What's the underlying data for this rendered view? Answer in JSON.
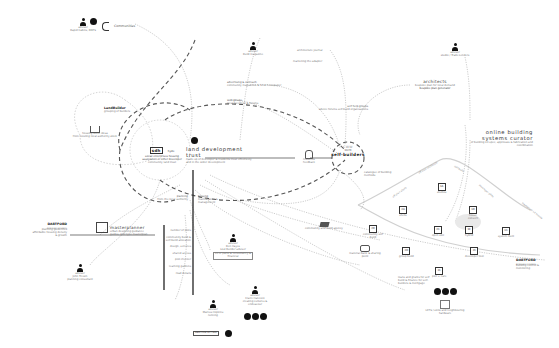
{
  "diagram": {
    "central": {
      "land_trust": {
        "title": "land development trust",
        "desc": "made up of developer & residents trust effectively and in the wider development"
      },
      "self_builders": {
        "logo": "CWW",
        "sub": "WLTB",
        "title": "self-builders"
      },
      "social_enterprises": {
        "logo": "sdh",
        "logo2": "hyde",
        "title": "social enterprises housing association or other developer",
        "desc": "community land trust"
      },
      "masterplanner": {
        "title": "masterplanner",
        "desc": "urban designing guidance guides, plot type masterplan"
      },
      "architects": {
        "title": "architects",
        "desc": "bespoke plan for local demand",
        "emph": "bespoke plan generator"
      },
      "online_curator": {
        "title": "online building systems curator",
        "desc": "of building kit spec, approvals & fabrication and coordination"
      }
    },
    "people": [
      {
        "id": "person-top-left",
        "role": "advisor",
        "name": "Rapid Cabins, BDPS"
      },
      {
        "id": "person-top-mid",
        "role": "advisor",
        "name": "Build magazine"
      },
      {
        "id": "person-architect",
        "role": "advisor",
        "name": "studio / Trade Lenders"
      },
      {
        "id": "person-planning",
        "role": "advisor",
        "name": "John Trewin",
        "extra": "planning consultant"
      },
      {
        "id": "person-finance",
        "role": "advisor",
        "name": "Ben Hayes",
        "extra": "Lost Builder adviser",
        "desc": "kit of parts & consultancy & financial"
      },
      {
        "id": "person-community",
        "role": "advisor",
        "name": "Claire Hancock",
        "extra": "creating cultures & endeavour"
      },
      {
        "id": "person-heritage",
        "role": "advisor",
        "name": "Marcus Hopkins",
        "extra": "running"
      }
    ],
    "labels": {
      "communities": "Communities",
      "landbuilder": "LandBuilder",
      "landbuilder_sub": "grouping of builders",
      "housing_stock": "housing stock ideas",
      "housing_stock_sub": "from existing local authority stock",
      "architecture_journal": "architecture journal",
      "marketing": "marketing the adapter",
      "advertising": "advertising & outreach",
      "advertising_sub": "community magazines & local newspaper",
      "web_groups": "web groups",
      "web_groups_sub": "local facebook & forums",
      "self_help": "self help groups",
      "self_help_sub": "advice forums self-build organisations",
      "planning": "planning",
      "planning_sub": "from the local authority",
      "housing_mgmt": "housing",
      "housing_mgmt_sub": "maintenance & management",
      "residents_feedback": "residents feedback",
      "ideas_building": "catalogue of building methods",
      "community_agency": "community and build agency",
      "materials_bank": "material bank & sharing point",
      "loan_text": "loans and grants for self build & finance for self-builders & mortgage",
      "lets_exchange": "LETS / skills and neighbouring hardware",
      "dartford_left": "DARTFORD",
      "dartford_left_sub": "BOROUGH COUNCIL",
      "dartford_left_desc": "planning guidelines affordable housing density & growth",
      "dartford_right": "DARTFORD",
      "dartford_right_sub": "BOROUGH COUNCIL",
      "dartford_right_desc": "building control & monitoring",
      "heritage_tag": "HERITAGE LOTTERY",
      "list_items": [
        "number of plots",
        "community build & self-build allocation",
        "design, services",
        "shared access",
        "plot checker",
        "learning gardens",
        "road details"
      ]
    },
    "build_types": [
      {
        "code": "1A",
        "label": "studios"
      },
      {
        "code": "1B",
        "label": "house convert"
      },
      {
        "code": "1C",
        "label": "system built"
      },
      {
        "code": "2A",
        "label": "shells"
      },
      {
        "code": "2B",
        "label": "community self build"
      },
      {
        "code": "2C",
        "label": "open slot"
      },
      {
        "code": "2D",
        "label": "group build"
      },
      {
        "code": "1E",
        "label": "hybrid"
      },
      {
        "code": "2C",
        "label": "developer tool"
      },
      {
        "code": "3C",
        "label": "plot + care"
      }
    ],
    "axis_labels": [
      "off plan architects",
      "off plan shells",
      "self-build",
      "developer plots",
      "tradesman kit homes"
    ],
    "colors": {
      "ink": "#222222",
      "line": "#999999",
      "dash": "#777777",
      "highlight": "#e9e9e9",
      "bg": "#ffffff"
    }
  }
}
